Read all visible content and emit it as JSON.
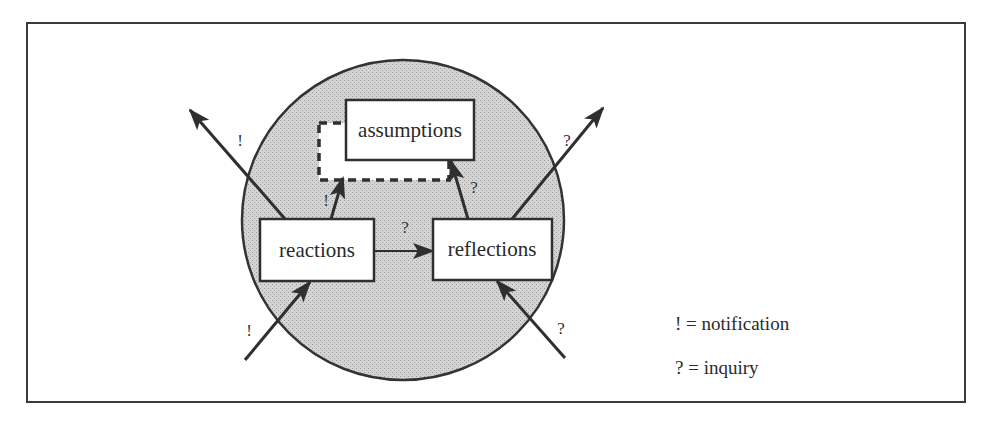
{
  "diagram": {
    "colors": {
      "frame": "#3a3a3a",
      "circle_fill": "#c8c8c8",
      "circle_stroke": "#333333",
      "box_fill": "#ffffff",
      "line": "#2f2f2f"
    },
    "nodes": {
      "assumptions": {
        "label": "assumptions"
      },
      "reactions": {
        "label": "reactions"
      },
      "reflections": {
        "label": "reflections"
      }
    },
    "edges": [
      {
        "id": "reactions-out",
        "from": "reactions",
        "to": "outside-upper-left",
        "mark": "!"
      },
      {
        "id": "reflections-out",
        "from": "reflections",
        "to": "outside-upper-right",
        "mark": "?"
      },
      {
        "id": "in-reactions",
        "from": "outside-lower-left",
        "to": "reactions",
        "mark": "!"
      },
      {
        "id": "in-reflections",
        "from": "outside-lower-right",
        "to": "reflections",
        "mark": "?"
      },
      {
        "id": "reactions-to-assumptions",
        "from": "reactions",
        "to": "assumptions",
        "mark": "!"
      },
      {
        "id": "reflections-to-assumptions",
        "from": "reflections",
        "to": "assumptions",
        "mark": "?"
      },
      {
        "id": "reactions-to-reflections",
        "from": "reactions",
        "to": "reflections",
        "mark": "?"
      }
    ],
    "legend": [
      {
        "symbol": "!",
        "text": "! = notification"
      },
      {
        "symbol": "?",
        "text": "? = inquiry"
      }
    ]
  }
}
